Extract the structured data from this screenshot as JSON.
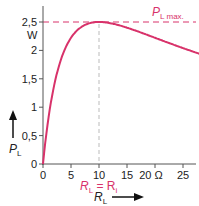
{
  "chart_data": {
    "type": "line",
    "title": "",
    "xlabel": "R_L",
    "ylabel": "P_L",
    "x_unit": "Ω",
    "y_unit": "W",
    "xlim": [
      0,
      28
    ],
    "ylim": [
      0,
      2.7
    ],
    "x_ticks": [
      "0",
      "5",
      "10",
      "15",
      "20 Ω",
      "25"
    ],
    "y_ticks": [
      "0",
      "0,5",
      "1",
      "1,5",
      "2",
      "2,5"
    ],
    "series": [
      {
        "name": "P_L",
        "color": "#d8326a",
        "x": [
          0,
          0.5,
          1,
          2,
          3,
          4,
          5,
          6,
          7,
          8,
          9,
          10,
          12,
          14,
          16,
          18,
          20,
          22,
          24,
          26,
          28
        ],
        "values": [
          0,
          0.45,
          0.83,
          1.39,
          1.78,
          2.04,
          2.22,
          2.34,
          2.42,
          2.47,
          2.49,
          2.5,
          2.48,
          2.43,
          2.37,
          2.3,
          2.22,
          2.15,
          2.08,
          2.01,
          1.94
        ]
      }
    ],
    "annotations": [
      {
        "text": "P_L max.",
        "type": "hline",
        "y": 2.5,
        "style": "dashed",
        "color": "#d8326a"
      },
      {
        "text": "R_L = R_i",
        "type": "vline",
        "x": 10,
        "style": "dashed",
        "color": "#aaaaaa"
      }
    ],
    "grid": false,
    "legend": "none"
  },
  "labels": {
    "y_unit": "W",
    "x_unit_tick": "20 Ω",
    "pmax_main": "P",
    "pmax_sub": "L",
    "pmax_suffix": "max.",
    "rl_eq_main": "R",
    "rl_eq_sub": "L",
    "rl_eq_mid": " = R",
    "rl_eq_sub2": "i",
    "xlabel_main": "R",
    "xlabel_sub": "L",
    "ylabel_main": "P",
    "ylabel_sub": "L"
  }
}
